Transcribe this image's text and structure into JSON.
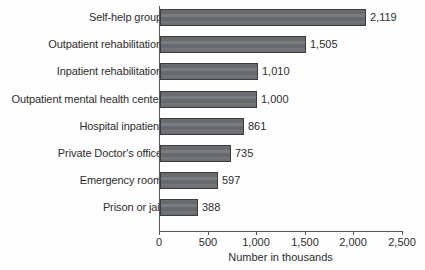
{
  "chart_data": {
    "type": "bar",
    "orientation": "horizontal",
    "title": "",
    "xlabel": "Number in thousands",
    "ylabel": "",
    "xlim": [
      0,
      2500
    ],
    "xticks": [
      0,
      500,
      1000,
      1500,
      2000,
      2500
    ],
    "xtick_labels": [
      "0",
      "500",
      "1,000",
      "1,500",
      "2,000",
      "2,500"
    ],
    "grid": false,
    "legend": null,
    "categories": [
      "Self-help group",
      "Outpatient rehabilitation",
      "Inpatient rehabilitation",
      "Outpatient mental health center",
      "Hospital inpatient",
      "Private Doctor's office",
      "Emergency room",
      "Prison or jail"
    ],
    "values": [
      2119,
      1505,
      1010,
      1000,
      861,
      597,
      735,
      388
    ],
    "bars": [
      {
        "label": "Self-help group",
        "value": 2119,
        "value_label": "2,119"
      },
      {
        "label": "Outpatient rehabilitation",
        "value": 1505,
        "value_label": "1,505"
      },
      {
        "label": "Inpatient rehabilitation",
        "value": 1010,
        "value_label": "1,010"
      },
      {
        "label": "Outpatient mental health center",
        "value": 1000,
        "value_label": "1,000"
      },
      {
        "label": "Hospital inpatient",
        "value": 861,
        "value_label": "861"
      },
      {
        "label": "Private Doctor's office",
        "value": 735,
        "value_label": "735"
      },
      {
        "label": "Emergency room",
        "value": 597,
        "value_label": "597"
      },
      {
        "label": "Prison or jail",
        "value": 388,
        "value_label": "388"
      }
    ],
    "colors": {
      "bar_fill": "#6f7073",
      "bar_border": "#3c3c3c",
      "axis": "#55565a",
      "text": "#2d2d2d",
      "background": "#fefefe"
    }
  }
}
